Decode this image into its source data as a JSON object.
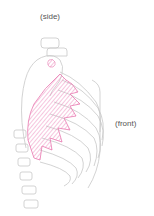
{
  "labels": {
    "side": "(side)",
    "front": "(front)"
  },
  "colors": {
    "bone_outline": "#c8c8c8",
    "muscle": "#e879b0",
    "muscle_fill": "#f7d3e6"
  }
}
